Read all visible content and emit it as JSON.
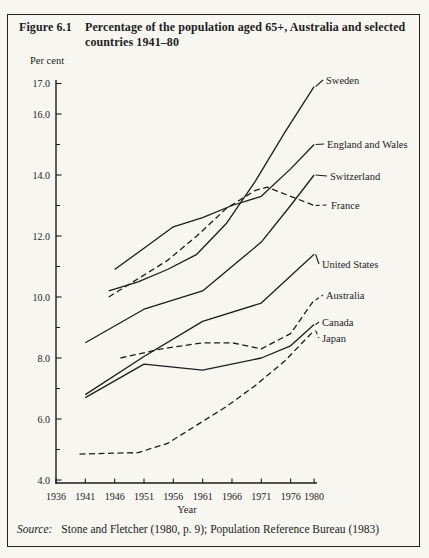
{
  "figure": {
    "label": "Figure 6.1",
    "title": "Percentage of the population aged 65+, Australia and selected countries 1941–80",
    "source_label": "Source:",
    "source_text": "Stone and Fletcher (1980, p. 9); Population Reference Bureau (1983)"
  },
  "colors": {
    "ink": "#1d1d1d",
    "paper": "#f7f6f1"
  },
  "chart_data": {
    "type": "line",
    "title": "Percentage of the population aged 65+, Australia and selected countries 1941–80",
    "ylabel": "Per cent",
    "xlabel": "Year",
    "xlim": [
      1936,
      1981
    ],
    "ylim": [
      4.0,
      17.0
    ],
    "grid": false,
    "legend_position": "right-annotations",
    "x_ticks": [
      1936,
      1941,
      1946,
      1951,
      1956,
      1961,
      1966,
      1971,
      1976,
      1980
    ],
    "x_tick_labels": [
      "1936",
      "1941",
      "1946",
      "1951",
      "1956",
      "1961",
      "1966",
      "1971",
      "1976",
      "1980"
    ],
    "y_ticks_major": [
      4,
      6,
      8,
      10,
      12,
      14,
      16,
      17
    ],
    "y_tick_labels": [
      "4.0",
      "6.0",
      "8.0",
      "10.0",
      "12.0",
      "14.0",
      "16.0",
      "17.0"
    ],
    "y_ticks_minor": [
      5,
      7,
      9,
      11,
      13,
      15
    ],
    "series": [
      {
        "name": "Sweden",
        "style": "solid",
        "points": [
          [
            1945,
            10.2
          ],
          [
            1950,
            10.5
          ],
          [
            1955,
            10.9
          ],
          [
            1960,
            11.4
          ],
          [
            1965,
            12.4
          ],
          [
            1970,
            13.8
          ],
          [
            1975,
            15.4
          ],
          [
            1980,
            16.9
          ]
        ],
        "label_pos": [
          326,
          80
        ]
      },
      {
        "name": "England and Wales",
        "style": "solid",
        "points": [
          [
            1946,
            10.9
          ],
          [
            1951,
            11.6
          ],
          [
            1956,
            12.3
          ],
          [
            1961,
            12.6
          ],
          [
            1966,
            13.0
          ],
          [
            1971,
            13.3
          ],
          [
            1976,
            14.2
          ],
          [
            1980,
            15.0
          ]
        ],
        "label_pos": [
          327,
          144
        ]
      },
      {
        "name": "Switzerland",
        "style": "solid",
        "points": [
          [
            1941,
            8.5
          ],
          [
            1951,
            9.6
          ],
          [
            1961,
            10.2
          ],
          [
            1971,
            11.8
          ],
          [
            1976,
            13.0
          ],
          [
            1980,
            14.0
          ]
        ],
        "label_pos": [
          330,
          176
        ]
      },
      {
        "name": "France",
        "style": "dashed",
        "points": [
          [
            1945,
            10.0
          ],
          [
            1950,
            10.6
          ],
          [
            1955,
            11.2
          ],
          [
            1960,
            12.0
          ],
          [
            1965,
            12.9
          ],
          [
            1970,
            13.5
          ],
          [
            1972,
            13.6
          ],
          [
            1976,
            13.3
          ],
          [
            1980,
            13.0
          ]
        ],
        "label_pos": [
          331,
          205
        ]
      },
      {
        "name": "United States",
        "style": "solid",
        "points": [
          [
            1941,
            6.8
          ],
          [
            1951,
            8.05
          ],
          [
            1961,
            9.2
          ],
          [
            1971,
            9.8
          ],
          [
            1980,
            11.4
          ]
        ],
        "label_pos": [
          322,
          264
        ]
      },
      {
        "name": "Australia",
        "style": "dashed",
        "points": [
          [
            1947,
            8.0
          ],
          [
            1954,
            8.3
          ],
          [
            1961,
            8.5
          ],
          [
            1966,
            8.5
          ],
          [
            1971,
            8.3
          ],
          [
            1976,
            8.8
          ],
          [
            1980,
            9.9
          ]
        ],
        "label_pos": [
          326,
          295
        ]
      },
      {
        "name": "Canada",
        "style": "solid",
        "points": [
          [
            1941,
            6.7
          ],
          [
            1951,
            7.8
          ],
          [
            1961,
            7.6
          ],
          [
            1971,
            8.0
          ],
          [
            1976,
            8.4
          ],
          [
            1980,
            9.1
          ]
        ],
        "label_pos": [
          322,
          322
        ]
      },
      {
        "name": "Japan",
        "style": "dashed",
        "points": [
          [
            1940,
            4.85
          ],
          [
            1950,
            4.9
          ],
          [
            1955,
            5.2
          ],
          [
            1960,
            5.8
          ],
          [
            1965,
            6.4
          ],
          [
            1970,
            7.1
          ],
          [
            1975,
            7.9
          ],
          [
            1980,
            8.9
          ]
        ],
        "label_pos": [
          322,
          338
        ]
      }
    ]
  }
}
